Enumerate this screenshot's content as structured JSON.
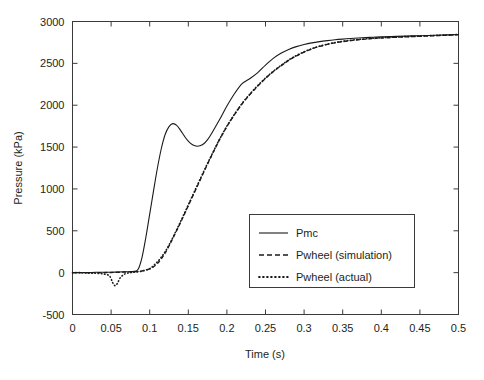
{
  "chart_data": {
    "type": "line",
    "title": "",
    "xlabel": "Time (s)",
    "ylabel": "Pressure (kPa)",
    "xlim": [
      0,
      0.5
    ],
    "ylim": [
      -500,
      3000
    ],
    "xticks": [
      "0",
      "0.05",
      "0.1",
      "0.15",
      "0.2",
      "0.25",
      "0.3",
      "0.35",
      "0.4",
      "0.45",
      "0.5"
    ],
    "xtick_values": [
      0,
      0.05,
      0.1,
      0.15,
      0.2,
      0.25,
      0.3,
      0.35,
      0.4,
      0.45,
      0.5
    ],
    "yticks": [
      "-500",
      "0",
      "500",
      "1000",
      "1500",
      "2000",
      "2500",
      "3000"
    ],
    "ytick_values": [
      -500,
      0,
      500,
      1000,
      1500,
      2000,
      2500,
      3000
    ],
    "grid": false,
    "legend_position": "center-right",
    "series": [
      {
        "name": "Pmc",
        "style": "solid",
        "x": [
          0,
          0.01,
          0.02,
          0.03,
          0.04,
          0.05,
          0.06,
          0.07,
          0.08,
          0.085,
          0.09,
          0.095,
          0.1,
          0.105,
          0.11,
          0.115,
          0.12,
          0.125,
          0.13,
          0.135,
          0.14,
          0.145,
          0.15,
          0.155,
          0.16,
          0.165,
          0.17,
          0.175,
          0.18,
          0.19,
          0.2,
          0.21,
          0.22,
          0.23,
          0.24,
          0.25,
          0.26,
          0.27,
          0.28,
          0.29,
          0.3,
          0.31,
          0.32,
          0.33,
          0.34,
          0.35,
          0.36,
          0.37,
          0.38,
          0.39,
          0.4,
          0.42,
          0.44,
          0.46,
          0.48,
          0.5
        ],
        "y": [
          0,
          0,
          0,
          5,
          5,
          5,
          8,
          10,
          15,
          40,
          180,
          420,
          700,
          980,
          1250,
          1480,
          1650,
          1745,
          1780,
          1760,
          1700,
          1630,
          1570,
          1530,
          1512,
          1515,
          1540,
          1590,
          1660,
          1820,
          1990,
          2140,
          2260,
          2320,
          2390,
          2480,
          2560,
          2620,
          2665,
          2700,
          2725,
          2745,
          2760,
          2772,
          2782,
          2790,
          2797,
          2803,
          2808,
          2812,
          2816,
          2822,
          2828,
          2833,
          2838,
          2845
        ]
      },
      {
        "name": "Pwheel (simulation)",
        "style": "dashed",
        "x": [
          0,
          0.01,
          0.02,
          0.03,
          0.04,
          0.05,
          0.06,
          0.07,
          0.08,
          0.09,
          0.1,
          0.105,
          0.11,
          0.115,
          0.12,
          0.125,
          0.13,
          0.14,
          0.15,
          0.16,
          0.17,
          0.18,
          0.19,
          0.2,
          0.21,
          0.22,
          0.23,
          0.24,
          0.25,
          0.26,
          0.27,
          0.28,
          0.29,
          0.3,
          0.31,
          0.32,
          0.33,
          0.34,
          0.35,
          0.36,
          0.37,
          0.38,
          0.39,
          0.4,
          0.42,
          0.44,
          0.46,
          0.48,
          0.5
        ],
        "y": [
          0,
          0,
          0,
          0,
          0,
          2,
          5,
          8,
          12,
          20,
          45,
          70,
          110,
          165,
          235,
          320,
          410,
          600,
          800,
          1000,
          1200,
          1395,
          1580,
          1745,
          1890,
          2020,
          2130,
          2230,
          2320,
          2400,
          2470,
          2535,
          2590,
          2635,
          2672,
          2702,
          2726,
          2745,
          2760,
          2772,
          2782,
          2790,
          2797,
          2803,
          2812,
          2820,
          2827,
          2834,
          2842
        ]
      },
      {
        "name": "Pwheel (actual)",
        "style": "dotted",
        "x": [
          0,
          0.01,
          0.02,
          0.03,
          0.04,
          0.048,
          0.052,
          0.055,
          0.058,
          0.062,
          0.068,
          0.075,
          0.08,
          0.09,
          0.1,
          0.105,
          0.11,
          0.115,
          0.12,
          0.125,
          0.13,
          0.14,
          0.15,
          0.16,
          0.17,
          0.18,
          0.19,
          0.2,
          0.21,
          0.22,
          0.23,
          0.24,
          0.25,
          0.26,
          0.27,
          0.28,
          0.29,
          0.3,
          0.31,
          0.32,
          0.33,
          0.34,
          0.35,
          0.36,
          0.37,
          0.38,
          0.39,
          0.4,
          0.42,
          0.44,
          0.46,
          0.48,
          0.5
        ],
        "y": [
          0,
          0,
          -5,
          -8,
          -15,
          -40,
          -120,
          -155,
          -130,
          -60,
          -15,
          0,
          5,
          18,
          48,
          85,
          130,
          185,
          250,
          330,
          420,
          610,
          810,
          1010,
          1210,
          1400,
          1585,
          1750,
          1895,
          2025,
          2135,
          2235,
          2325,
          2405,
          2475,
          2540,
          2593,
          2638,
          2675,
          2705,
          2729,
          2748,
          2763,
          2775,
          2785,
          2793,
          2800,
          2806,
          2815,
          2823,
          2830,
          2837,
          2845
        ]
      }
    ],
    "legend": [
      {
        "label": "Pmc",
        "style": "solid"
      },
      {
        "label": "Pwheel (simulation)",
        "style": "dashed"
      },
      {
        "label": "Pwheel (actual)",
        "style": "dotted"
      }
    ]
  }
}
